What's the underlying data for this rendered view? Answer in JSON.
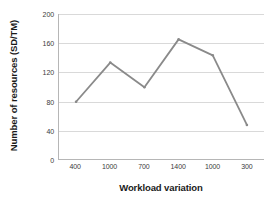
{
  "chart_data": {
    "type": "line",
    "title": "",
    "xlabel": "Workload variation",
    "ylabel": "Number of resources (SD/TM)",
    "categories": [
      "400",
      "1000",
      "700",
      "1400",
      "1000",
      "300"
    ],
    "values": [
      79,
      133,
      99,
      165,
      143,
      47
    ],
    "series": [
      {
        "name": "Number of resources",
        "values": [
          79,
          133,
          99,
          165,
          143,
          47
        ],
        "color": "#8a8a8a"
      }
    ],
    "ylim": [
      0,
      200
    ],
    "ytick_step": 40,
    "yticks": [
      "200",
      "160",
      "120",
      "80",
      "40",
      "0"
    ],
    "ytick_values": [
      200,
      160,
      120,
      80,
      40,
      0
    ],
    "grid": true,
    "grid_axis": "y",
    "legend": false,
    "legend_position": "none",
    "marker": "none",
    "line_color": "#8a8a8a",
    "grid_color": "#d9d9d9",
    "axis_color": "#b6b6b6",
    "background": "#ffffff"
  }
}
